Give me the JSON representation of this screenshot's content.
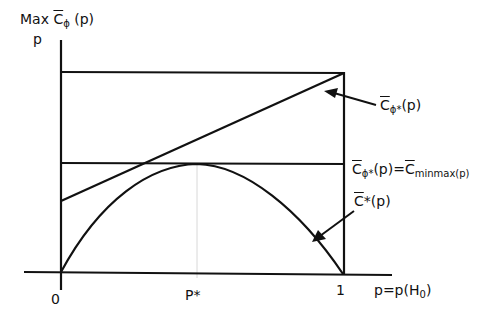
{
  "y_axis": {
    "label_line1_prefix": "Max ",
    "label_line1_symbol": "C",
    "label_line1_sub": "ϕ",
    "label_line1_suffix": " (p)",
    "label_line2": "p"
  },
  "x_axis": {
    "tick_0": "0",
    "tick_pstar": "P*",
    "tick_1": "1",
    "label_main": "p=p(H",
    "label_sub": "0",
    "label_end": ")"
  },
  "curves": {
    "linear_label_symbol": "C",
    "linear_label_sub": "ϕ*",
    "linear_label_suffix": "(p)",
    "minmax_label_symbol": "C",
    "minmax_label_sub": "ϕ*",
    "minmax_label_mid": "(p)=",
    "minmax_label_symbol2": "C",
    "minmax_label_sub2": "minmax(p)",
    "bayes_label_symbol": "C",
    "bayes_label_suffix": "*(p)"
  },
  "colors": {
    "line": "#111111",
    "guide": "#d8d8d8"
  }
}
